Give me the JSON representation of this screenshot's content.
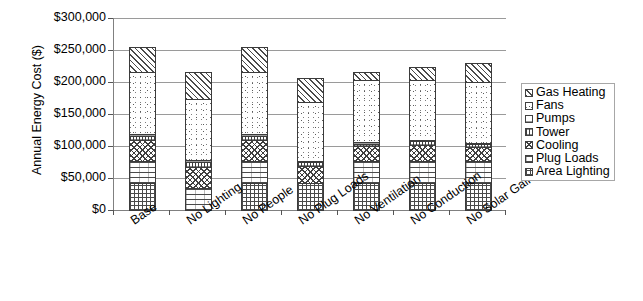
{
  "chart_data": {
    "type": "bar",
    "stacked": true,
    "title": "",
    "xlabel": "",
    "ylabel": "Annual Energy Cost ($)",
    "ylim": [
      0,
      300000
    ],
    "ytick_step": 50000,
    "ytick_labels": [
      "$300,000",
      "$250,000",
      "$200,000",
      "$150,000",
      "$100,000",
      "$50,000",
      "$0"
    ],
    "ytick_values": [
      300000,
      250000,
      200000,
      150000,
      100000,
      50000,
      0
    ],
    "grid": true,
    "legend_position": "right",
    "categories": [
      "Base",
      "No Lighting",
      "No People",
      "No Plug Loads",
      "No Ventilation",
      "No Conduction",
      "No Solar Gains"
    ],
    "series": [
      {
        "name": "Area Lighting",
        "pattern": "cross-hatch-grid",
        "values": [
          43000,
          0,
          43000,
          43000,
          43000,
          43000,
          43000
        ]
      },
      {
        "name": "Plug Loads",
        "pattern": "horizontal-dashes",
        "values": [
          36000,
          36000,
          36000,
          0,
          36000,
          36000,
          36000
        ]
      },
      {
        "name": "Cooling",
        "pattern": "diagonal-cross",
        "values": [
          35000,
          35000,
          35000,
          29000,
          25000,
          28000,
          24000
        ]
      },
      {
        "name": "Tower",
        "pattern": "fine-vertical",
        "values": [
          8000,
          8000,
          8000,
          7000,
          6000,
          7000,
          6000
        ]
      },
      {
        "name": "Pumps",
        "pattern": "horizontal-lines",
        "values": [
          5000,
          5000,
          5000,
          4000,
          4000,
          4000,
          4000
        ]
      },
      {
        "name": "Fans",
        "pattern": "speckled-dots",
        "values": [
          98000,
          98000,
          98000,
          94000,
          98000,
          95000,
          96000
        ]
      },
      {
        "name": "Gas Heating",
        "pattern": "diagonal-hatch",
        "values": [
          40000,
          43000,
          40000,
          38000,
          15000,
          22000,
          32000
        ]
      }
    ],
    "totals": [
      265000,
      225000,
      265000,
      215000,
      227000,
      235000,
      241000
    ]
  },
  "legend": {
    "items": [
      {
        "label": "Gas Heating"
      },
      {
        "label": "Fans"
      },
      {
        "label": "Pumps"
      },
      {
        "label": "Tower"
      },
      {
        "label": "Cooling"
      },
      {
        "label": "Plug Loads"
      },
      {
        "label": "Area Lighting"
      }
    ]
  }
}
